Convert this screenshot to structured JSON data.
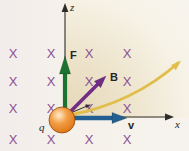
{
  "axes": {
    "z_label": "z",
    "x_label": "x",
    "color": "#2e2c29"
  },
  "vectors": {
    "force": {
      "label": "F",
      "color": "#1c7231"
    },
    "field": {
      "label": "B",
      "color": "#712c85"
    },
    "velocity": {
      "label": "v",
      "color": "#235f90"
    }
  },
  "trajectory": {
    "color": "#e1be4b"
  },
  "particle": {
    "label": "q",
    "highlight": "#ffedcd",
    "mid": "#f29e45",
    "edge": "#c35c0a"
  },
  "field_marks": {
    "symbol": "X",
    "color": "#8b4f94",
    "col_x": [
      13,
      51,
      89,
      127
    ],
    "row_y": [
      53,
      81,
      108,
      139
    ]
  },
  "background": {
    "page": "#f4f0ea",
    "shade": "#e4d6b6"
  }
}
